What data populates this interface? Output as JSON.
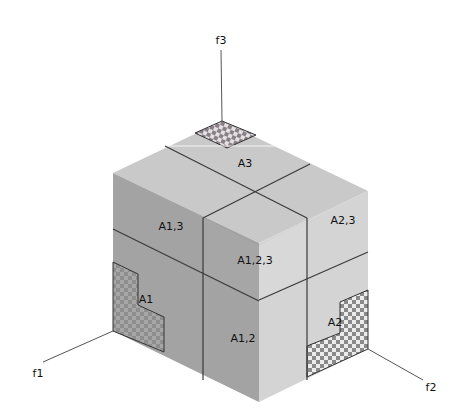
{
  "diagram": {
    "axes": {
      "f1": "f1",
      "f2": "f2",
      "f3": "f3"
    },
    "regions": {
      "A1": "A1",
      "A2": "A2",
      "A3": "A3",
      "A12": "A1,2",
      "A13": "A1,3",
      "A23": "A2,3",
      "A123": "A1,2,3"
    },
    "colors": {
      "top_face": "#c9c9c9",
      "left_face": "#a3a3a3",
      "right_face": "#d4d4d4",
      "edge": "#3a3a3a",
      "checker_dark": "#8a8a8a",
      "checker_light": "#e6e6e6"
    }
  }
}
